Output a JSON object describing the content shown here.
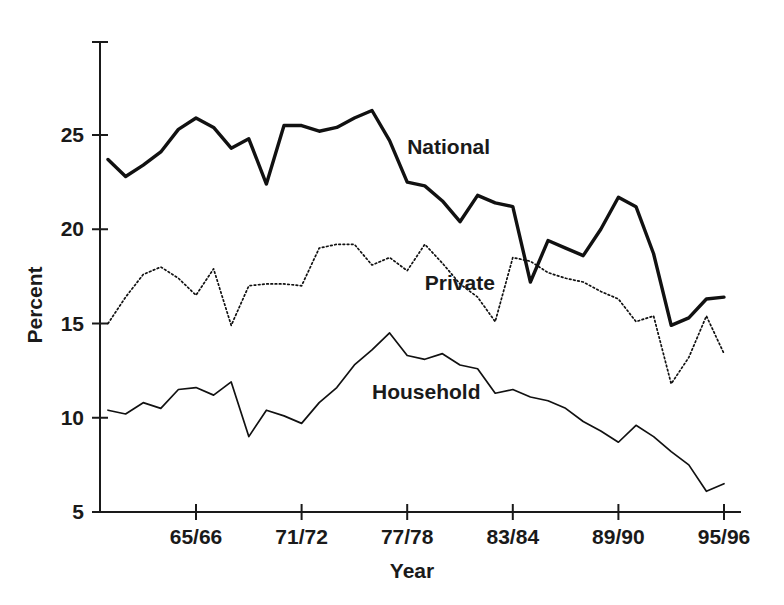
{
  "chart_data": {
    "type": "line",
    "title": "",
    "xlabel": "Year",
    "ylabel": "Percent",
    "ylim": [
      5,
      28.5
    ],
    "xlim": [
      1960,
      1996
    ],
    "grid": false,
    "legend": "inline-annotations",
    "y_ticks": [
      {
        "value": 25,
        "label": "25"
      },
      {
        "value": 20,
        "label": "20"
      },
      {
        "value": 15,
        "label": "15"
      },
      {
        "value": 10,
        "label": "10"
      },
      {
        "value": 5,
        "label": "5"
      }
    ],
    "x_ticks": [
      {
        "value": 1965,
        "label": "65/66"
      },
      {
        "value": 1971,
        "label": "71/72"
      },
      {
        "value": 1977,
        "label": "77/78"
      },
      {
        "value": 1983,
        "label": "83/84"
      },
      {
        "value": 1989,
        "label": "89/90"
      },
      {
        "value": 1995,
        "label": "95/96"
      }
    ],
    "x": [
      1960,
      1961,
      1962,
      1963,
      1964,
      1965,
      1966,
      1967,
      1968,
      1969,
      1970,
      1971,
      1972,
      1973,
      1974,
      1975,
      1976,
      1977,
      1978,
      1979,
      1980,
      1981,
      1982,
      1983,
      1984,
      1985,
      1986,
      1987,
      1988,
      1989,
      1990,
      1991,
      1992,
      1993,
      1994,
      1995
    ],
    "series": [
      {
        "name": "National",
        "label": "National",
        "style": "solid-bold",
        "label_x": 1977,
        "label_y": 24.0,
        "values": [
          23.7,
          22.8,
          23.4,
          24.1,
          25.3,
          25.9,
          25.4,
          24.3,
          24.8,
          22.4,
          25.5,
          25.5,
          25.2,
          25.4,
          25.9,
          26.3,
          24.7,
          22.5,
          22.3,
          21.5,
          20.4,
          21.8,
          21.4,
          21.2,
          17.2,
          19.4,
          19.0,
          18.6,
          20.0,
          21.7,
          21.2,
          18.7,
          14.9,
          15.3,
          16.3,
          16.4
        ]
      },
      {
        "name": "Private",
        "label": "Private",
        "style": "dotted",
        "label_x": 1978,
        "label_y": 16.8,
        "values": [
          15.0,
          16.4,
          17.6,
          18.0,
          17.4,
          16.5,
          17.9,
          14.9,
          17.0,
          17.1,
          17.1,
          17.0,
          19.0,
          19.2,
          19.2,
          18.1,
          18.5,
          17.8,
          19.2,
          18.2,
          17.1,
          16.4,
          15.1,
          18.5,
          18.3,
          17.7,
          17.4,
          17.2,
          16.7,
          16.3,
          15.1,
          15.4,
          11.8,
          13.2,
          15.4,
          13.4
        ]
      },
      {
        "name": "Household",
        "label": "Household",
        "style": "solid-thin",
        "label_x": 1975,
        "label_y": 11.0,
        "values": [
          10.4,
          10.2,
          10.8,
          10.5,
          11.5,
          11.6,
          11.2,
          11.9,
          9.0,
          10.4,
          10.1,
          9.7,
          10.8,
          11.6,
          12.8,
          13.6,
          14.5,
          13.3,
          13.1,
          13.4,
          12.8,
          12.6,
          11.3,
          11.5,
          11.1,
          10.9,
          10.5,
          9.8,
          9.3,
          8.7,
          9.6,
          9.0,
          8.2,
          7.5,
          6.1,
          6.5
        ]
      }
    ]
  }
}
